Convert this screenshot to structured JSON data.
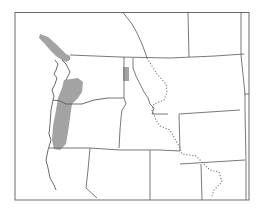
{
  "map": {
    "type": "species-range-map",
    "region": "Pacific Northwest, western North America",
    "regions_depicted": [
      "Washington",
      "Oregon",
      "Idaho",
      "Montana",
      "Wyoming",
      "California",
      "Nevada",
      "Utah",
      "British Columbia",
      "Alberta"
    ],
    "legend": null,
    "labels": [],
    "colors": {
      "background": "#ffffff",
      "range_fill": "#a3a3a3",
      "borders": "#6a6a6a",
      "continental_divide": "#7a7a7a"
    },
    "features": {
      "range_areas": [
        {
          "name": "vancouver-island-puget-sound",
          "description": "Vancouver Island and northwestern Washington"
        },
        {
          "name": "oregon-cascades-coast-range",
          "description": "Western Oregon and southwestern Washington strip"
        },
        {
          "name": "northern-idaho-patch",
          "description": "Small patch in northern Idaho panhandle"
        }
      ],
      "continental_divide": "dotted line through Montana and Wyoming"
    }
  }
}
